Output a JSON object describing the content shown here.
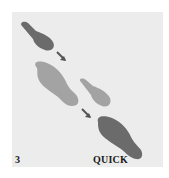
{
  "diagram": {
    "type": "dance-footprint-step",
    "step_number": "3",
    "tempo_label": "QUICK",
    "colors": {
      "background": "#ececec",
      "dark_foot": "#6b6b6b",
      "light_foot": "#a3a3a3",
      "arrow": "#555555",
      "text": "#1a1a1a"
    },
    "footprints": [
      {
        "id": "dark-small-top",
        "shade": "dark",
        "part": "ball-of-foot"
      },
      {
        "id": "light-large-left",
        "shade": "light",
        "part": "full-foot"
      },
      {
        "id": "light-small-right",
        "shade": "light",
        "part": "ball-of-foot"
      },
      {
        "id": "dark-large-bottom",
        "shade": "dark",
        "part": "full-foot"
      }
    ],
    "arrows": [
      {
        "id": "arrow-top",
        "direction": "down-right"
      },
      {
        "id": "arrow-middle",
        "direction": "down-right"
      }
    ]
  }
}
